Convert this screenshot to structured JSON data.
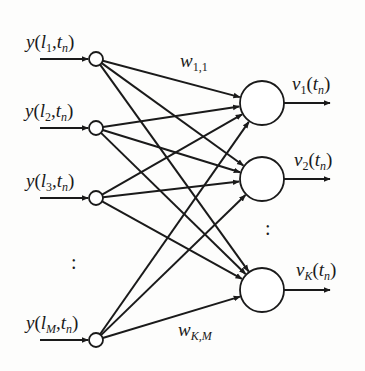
{
  "diagram": {
    "type": "single-layer fully connected neural network",
    "colors": {
      "stroke": "#1a1a1a",
      "background": "#fdfdfc"
    },
    "inputs": [
      {
        "id": "in1",
        "label_fn": "y",
        "label_l": "l",
        "label_l_sub": "1",
        "label_t": "t",
        "label_t_sub": "n",
        "x": 96,
        "y": 59
      },
      {
        "id": "in2",
        "label_fn": "y",
        "label_l": "l",
        "label_l_sub": "2",
        "label_t": "t",
        "label_t_sub": "n",
        "x": 96,
        "y": 128
      },
      {
        "id": "in3",
        "label_fn": "y",
        "label_l": "l",
        "label_l_sub": "3",
        "label_t": "t",
        "label_t_sub": "n",
        "x": 96,
        "y": 198
      },
      {
        "id": "inM",
        "label_fn": "y",
        "label_l": "l",
        "label_l_sub": "M",
        "label_t": "t",
        "label_t_sub": "n",
        "x": 96,
        "y": 340
      }
    ],
    "outputs": [
      {
        "id": "out1",
        "label_fn": "v",
        "label_sub": "1",
        "label_t": "t",
        "label_t_sub": "n",
        "x": 262,
        "y": 103
      },
      {
        "id": "out2",
        "label_fn": "v",
        "label_sub": "2",
        "label_t": "t",
        "label_t_sub": "n",
        "x": 262,
        "y": 179
      },
      {
        "id": "outK",
        "label_fn": "v",
        "label_sub": "K",
        "label_t": "t",
        "label_t_sub": "n",
        "x": 262,
        "y": 290
      }
    ],
    "weights": [
      {
        "symbol": "w",
        "sub": "1,1"
      },
      {
        "symbol": "w",
        "sub": "K,M"
      }
    ],
    "ellipsis": ":",
    "punct": {
      "open": "(",
      "comma": ",",
      "close": ")"
    }
  }
}
